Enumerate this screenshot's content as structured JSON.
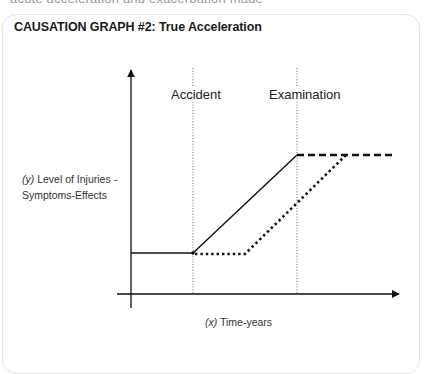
{
  "page": {
    "cut_off_text": "acute acceleration and exacerbation made"
  },
  "card": {
    "title": "CAUSATION GRAPH #2: True Acceleration"
  },
  "diagram": {
    "event_labels": [
      {
        "id": "accident",
        "label": "Accident"
      },
      {
        "id": "examination",
        "label": "Examination"
      }
    ],
    "y_axis": {
      "var": "(y)",
      "label_line1": " Level of Injuries -",
      "label_line2": "Symptoms-Effects"
    },
    "x_axis": {
      "var": "(x)",
      "label": " Time-years"
    },
    "colors": {
      "line": "#111111",
      "guide": "#555555",
      "border": "#e6e6e6"
    },
    "series": [
      {
        "name": "actual (solid)",
        "style": "solid",
        "points": [
          [
            131,
            253
          ],
          [
            193,
            253
          ],
          [
            297,
            155
          ]
        ]
      },
      {
        "name": "continued (dashed)",
        "style": "dashed",
        "points": [
          [
            297,
            155
          ],
          [
            395,
            155
          ]
        ]
      },
      {
        "name": "natural progression (dotted)",
        "style": "dotted",
        "points": [
          [
            193,
            254
          ],
          [
            245,
            254
          ],
          [
            346,
            155
          ]
        ]
      }
    ]
  }
}
